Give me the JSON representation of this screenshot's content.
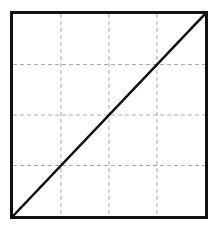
{
  "figure": {
    "title": "",
    "background_color": "#ffffff",
    "width": 218,
    "height": 229
  },
  "plot_area": {
    "frame_color": "#111111",
    "frame_width_px": 3,
    "fill_color": "#ffffff",
    "left_px": 10,
    "top_px": 11,
    "width_px": 198,
    "height_px": 208
  },
  "grid": {
    "visible": true,
    "style": "dashed",
    "color": "#aaaaaa",
    "line_width_px": 1,
    "dash_pattern": "4,3",
    "vertical_positions": [
      0.25,
      0.5,
      0.75
    ],
    "horizontal_positions": [
      0.25,
      0.5,
      0.75
    ]
  },
  "chart_data": {
    "type": "line",
    "title": "",
    "subtitle": "",
    "xlabel": "",
    "ylabel": "",
    "xlim": [
      0,
      1
    ],
    "ylim": [
      0,
      1
    ],
    "grid": true,
    "legend": null,
    "legend_position": "none",
    "xticks": [
      0,
      0.25,
      0.5,
      0.75,
      1
    ],
    "yticks": [
      0,
      0.25,
      0.5,
      0.75,
      1
    ],
    "xticklabels": [
      "",
      "",
      "",
      "",
      ""
    ],
    "yticklabels": [
      "",
      "",
      "",
      "",
      ""
    ],
    "annotations": [],
    "series": [
      {
        "name": "identity-line",
        "type": "line",
        "color": "#111111",
        "line_width_px": 2.5,
        "line_style": "solid",
        "description": "diagonal reference line y = x from bottom-left corner to top-right corner",
        "x": [
          0,
          1
        ],
        "y": [
          0,
          1
        ]
      }
    ]
  }
}
